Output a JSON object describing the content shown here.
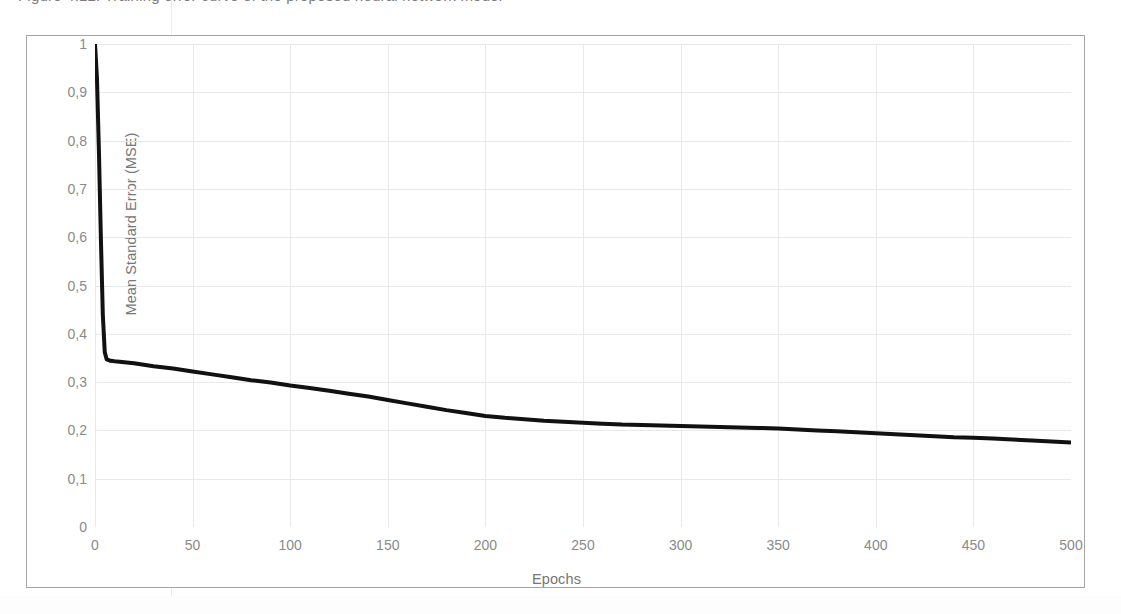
{
  "figure": {
    "caption_remnant": "Figure 4.12: Training error curve of the proposed neural network model",
    "background_color": "#ffffff",
    "frame_color": "#a6a6a6",
    "line_color": "#111111",
    "grid_color": "#e9e9e9",
    "tick_label_color": "#8a8a8a"
  },
  "chart_data": {
    "type": "line",
    "title": "",
    "xlabel": "Epochs",
    "ylabel": "Mean Standard Error (MSE)",
    "xlim": [
      0,
      500
    ],
    "ylim": [
      0,
      1
    ],
    "xticks": [
      0,
      50,
      100,
      150,
      200,
      250,
      300,
      350,
      400,
      450,
      500
    ],
    "xtick_labels": [
      "0",
      "50",
      "100",
      "150",
      "200",
      "250",
      "300",
      "350",
      "400",
      "450",
      "500"
    ],
    "yticks": [
      0,
      0.1,
      0.2,
      0.3,
      0.4,
      0.5,
      0.6,
      0.7,
      0.8,
      0.9,
      1
    ],
    "ytick_labels": [
      "0",
      "0,1",
      "0,2",
      "0,3",
      "0,4",
      "0,5",
      "0,6",
      "0,7",
      "0,8",
      "0,9",
      "1"
    ],
    "grid": true,
    "legend": false,
    "decimal_separator": ",",
    "series": [
      {
        "name": "Mean Standard Error (MSE)",
        "color": "#111111",
        "line_width": 4,
        "x": [
          0,
          1,
          2,
          3,
          4,
          5,
          6,
          8,
          10,
          15,
          20,
          25,
          30,
          40,
          50,
          60,
          70,
          80,
          90,
          100,
          110,
          120,
          130,
          140,
          150,
          160,
          170,
          180,
          190,
          200,
          210,
          220,
          230,
          240,
          250,
          260,
          270,
          280,
          290,
          300,
          310,
          320,
          330,
          340,
          350,
          360,
          370,
          380,
          390,
          400,
          410,
          420,
          430,
          440,
          450,
          460,
          470,
          480,
          490,
          500
        ],
        "y": [
          1.0,
          0.93,
          0.78,
          0.6,
          0.44,
          0.362,
          0.347,
          0.344,
          0.343,
          0.341,
          0.339,
          0.336,
          0.333,
          0.328,
          0.322,
          0.316,
          0.31,
          0.304,
          0.299,
          0.293,
          0.288,
          0.282,
          0.276,
          0.27,
          0.263,
          0.256,
          0.249,
          0.242,
          0.236,
          0.23,
          0.226,
          0.223,
          0.22,
          0.218,
          0.216,
          0.214,
          0.212,
          0.211,
          0.21,
          0.209,
          0.208,
          0.207,
          0.206,
          0.205,
          0.204,
          0.202,
          0.2,
          0.198,
          0.196,
          0.194,
          0.192,
          0.19,
          0.188,
          0.186,
          0.185,
          0.183,
          0.181,
          0.179,
          0.177,
          0.175
        ]
      }
    ],
    "annotations": {
      "start_value": "1",
      "elbow_value": "0,345",
      "final_value": "0,175"
    }
  }
}
